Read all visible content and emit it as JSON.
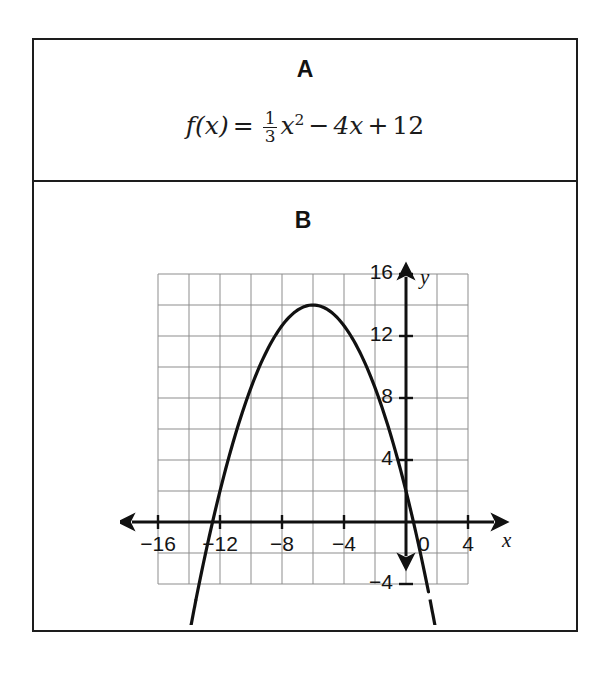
{
  "page": {
    "background": "#ffffff",
    "border_color": "#1d1d1d"
  },
  "panel_a": {
    "label": "A",
    "formula": {
      "lhs": "f(x)",
      "equals": "=",
      "fraction_numerator": "1",
      "fraction_denominator": "3",
      "term_x": "x",
      "term_exponent": "2",
      "minus": "−",
      "term_linear": "4x",
      "plus": "+",
      "constant": "12",
      "plain": "f(x) = 1/3 x² − 4x + 12"
    }
  },
  "panel_b": {
    "label": "B",
    "x_axis_name": "x",
    "y_axis_name": "y"
  },
  "chart_data": {
    "type": "line",
    "title": "",
    "subtitle": "",
    "xlabel": "x",
    "ylabel": "y",
    "grid": true,
    "grid_step_x": 2,
    "grid_step_y": 2,
    "legend": "none",
    "xlim": [
      -18,
      6
    ],
    "ylim": [
      -6,
      18
    ],
    "xticks": [
      -16,
      -12,
      -8,
      -4,
      0,
      4
    ],
    "yticks": [
      16,
      12,
      8,
      4,
      -4
    ],
    "xtick_labels": [
      "−16",
      "−12",
      "−8",
      "−4",
      "0",
      "4"
    ],
    "ytick_labels": [
      "16",
      "12",
      "8",
      "4",
      "−4"
    ],
    "origin_label": "0",
    "annotations": [],
    "series": [
      {
        "name": "parabola",
        "equation_plotted": "y = -(1/3)(x + 6)^2 + 14",
        "color": "#111111",
        "vertex": [
          -6,
          14
        ],
        "y_intercept": 6,
        "x_intercepts": [
          -13.5,
          1.5
        ],
        "arrow_ends": true,
        "x": [
          -14.2,
          -13.5,
          -13,
          -12,
          -11,
          -10,
          -9,
          -8,
          -7,
          -6,
          -5,
          -4,
          -3,
          -2,
          -1,
          0,
          1,
          1.5,
          2.2
        ],
        "y": [
          -7.5,
          0,
          2.7,
          2.0,
          5.7,
          8.7,
          11.0,
          12.7,
          13.7,
          14.0,
          13.7,
          12.7,
          11.0,
          8.7,
          5.7,
          6.0,
          1.7,
          0,
          -7.5
        ]
      }
    ]
  }
}
